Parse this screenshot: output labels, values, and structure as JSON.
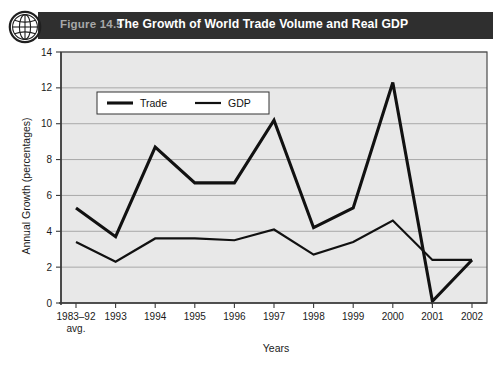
{
  "header": {
    "figure_number": "Figure 14.5",
    "title": "The Growth of World Trade Volume and Real GDP",
    "icon": "globe-icon",
    "band_color": "#2f2f2f",
    "number_color": "#a8a8a8",
    "title_color": "#ffffff"
  },
  "chart_data": {
    "type": "line",
    "title": "The Growth of World Trade Volume and Real GDP",
    "xlabel": "Years",
    "ylabel": "Annual Growth (percentages)",
    "categories": [
      "1983–92\navg.",
      "1993",
      "1994",
      "1995",
      "1996",
      "1997",
      "1998",
      "1999",
      "2000",
      "2001",
      "2002"
    ],
    "category_labels": [
      {
        "line1": "1983–92",
        "line2": "avg."
      },
      {
        "line1": "1993",
        "line2": ""
      },
      {
        "line1": "1994",
        "line2": ""
      },
      {
        "line1": "1995",
        "line2": ""
      },
      {
        "line1": "1996",
        "line2": ""
      },
      {
        "line1": "1997",
        "line2": ""
      },
      {
        "line1": "1998",
        "line2": ""
      },
      {
        "line1": "1999",
        "line2": ""
      },
      {
        "line1": "2000",
        "line2": ""
      },
      {
        "line1": "2001",
        "line2": ""
      },
      {
        "line1": "2002",
        "line2": ""
      }
    ],
    "ylim": [
      0,
      14
    ],
    "yticks": [
      0,
      2,
      4,
      6,
      8,
      10,
      12,
      14
    ],
    "ytick_labels": [
      "0",
      "2",
      "4",
      "6",
      "8",
      "10",
      "12",
      "14"
    ],
    "grid": true,
    "legend_position": "top-left-inside",
    "series": [
      {
        "name": "Trade",
        "color": "#111111",
        "width": 3.1,
        "values": [
          5.3,
          3.7,
          8.7,
          6.7,
          6.7,
          10.2,
          4.2,
          5.3,
          12.3,
          0.1,
          2.4
        ]
      },
      {
        "name": "GDP",
        "color": "#111111",
        "width": 2.2,
        "values": [
          3.4,
          2.3,
          3.6,
          3.6,
          3.5,
          4.1,
          2.7,
          3.4,
          4.6,
          2.4,
          2.4
        ]
      }
    ]
  },
  "plot_style": {
    "plot_background": "#e8e8e8",
    "grid_color": "#8d8d8d",
    "frame_color": "#4a4a4a",
    "axis_color": "#3a3a3a",
    "legend_background": "#ffffff",
    "legend_border": "#333333"
  }
}
